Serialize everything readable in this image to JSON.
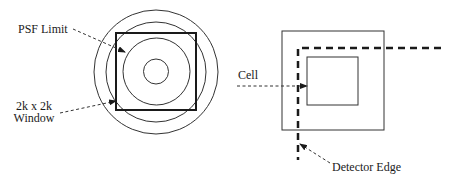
{
  "diagram": {
    "left_panel": {
      "labels": {
        "psf_limit": "PSF Limit",
        "window_line1": "2k x 2k",
        "window_line2": "Window"
      },
      "circles": [
        {
          "name": "outer-ring",
          "cx": 156,
          "cy": 72,
          "r": 62
        },
        {
          "name": "second-ring",
          "cx": 156,
          "cy": 72,
          "r": 50
        },
        {
          "name": "psf-limit-ring",
          "cx": 156,
          "cy": 72,
          "r": 34
        },
        {
          "name": "inner-ring",
          "cx": 156,
          "cy": 72,
          "r": 12.5
        }
      ],
      "window_square": {
        "x": 116,
        "y": 33,
        "w": 80,
        "h": 77
      }
    },
    "right_panel": {
      "labels": {
        "cell": "Cell",
        "detector_edge": "Detector Edge"
      },
      "outer_square": {
        "x": 282,
        "y": 31,
        "w": 102,
        "h": 99
      },
      "cell_square": {
        "x": 307,
        "y": 57,
        "w": 51,
        "h": 48
      }
    },
    "colors": {
      "stroke": "#1a1a1a",
      "background": "#ffffff"
    }
  }
}
